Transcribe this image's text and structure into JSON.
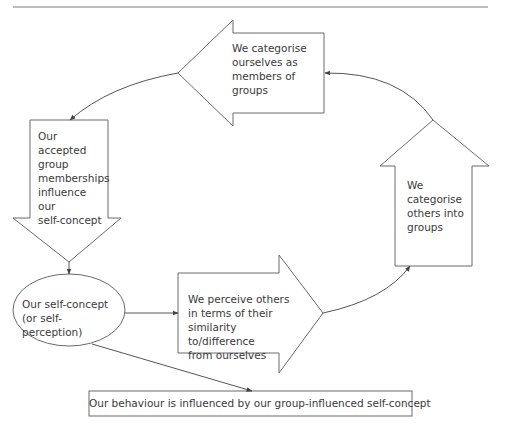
{
  "diagram": {
    "nodes": {
      "categorise_self": {
        "label": "We categorise\nourselves as\nmembers of\ngroups",
        "shape": "left-arrow"
      },
      "accepted_memberships": {
        "label": "Our\naccepted\ngroup\nmemberships\ninfluence\nour\nself-concept",
        "shape": "down-arrow"
      },
      "self_concept": {
        "label": "Our self-concept\n(or self-perception)",
        "shape": "ellipse"
      },
      "perceive_others": {
        "label": "We perceive others\nin terms of their\nsimilarity to/difference\nfrom ourselves",
        "shape": "right-arrow"
      },
      "categorise_others": {
        "label": "We\ncategorise\nothers into\ngroups",
        "shape": "up-arrow"
      },
      "behaviour": {
        "label": "Our behaviour is influenced by our group-influenced self-concept",
        "shape": "box"
      }
    },
    "edges": [
      {
        "from": "categorise_others",
        "to": "categorise_self"
      },
      {
        "from": "categorise_self",
        "to": "accepted_memberships"
      },
      {
        "from": "accepted_memberships",
        "to": "self_concept"
      },
      {
        "from": "self_concept",
        "to": "perceive_others"
      },
      {
        "from": "perceive_others",
        "to": "categorise_others"
      },
      {
        "from": "self_concept",
        "to": "behaviour"
      }
    ],
    "colors": {
      "stroke": "#6a6a6a",
      "text": "#3a3a3a",
      "background": "#ffffff"
    }
  }
}
